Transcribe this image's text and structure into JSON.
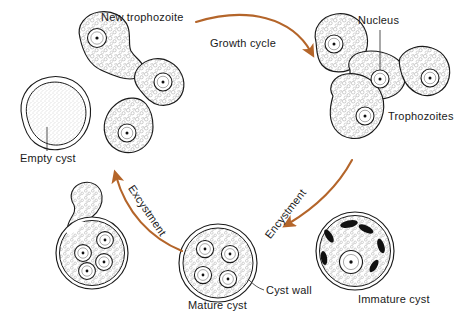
{
  "figure": {
    "title_text": "Entamoeba life cycle diagram",
    "ink_color": "#1a1a1a",
    "arrow_color": "#b4652a",
    "cell_fill": "#fefefe",
    "stipple_color": "#8a8a8a",
    "chromatoid_color": "#111111"
  },
  "labels": {
    "new_trophozoite": "New trophozoite",
    "growth_cycle": "Growth cycle",
    "nucleus": "Nucleus",
    "trophozoites": "Trophozoites",
    "empty_cyst": "Empty cyst",
    "excystment": "Excystment",
    "encystment": "Encystment",
    "mature_cyst": "Mature cyst",
    "cyst_wall": "Cyst wall",
    "immature_cyst": "Immature cyst"
  },
  "stages": [
    {
      "id": "new-trophozoite-chain",
      "name": "New trophozoite",
      "nuclei_count": 3,
      "description": "Three budding amoeboid cells connected in a chain, upper left"
    },
    {
      "id": "trophozoite-cluster",
      "name": "Trophozoites",
      "nuclei_count": 4,
      "description": "Cluster of four irregular trophozoites, upper right"
    },
    {
      "id": "immature-cyst",
      "name": "Immature cyst",
      "nuclei_count": 1,
      "chromatoid_bodies": 6,
      "description": "Round cyst with one nucleus and dark chromatoid bars"
    },
    {
      "id": "mature-cyst",
      "name": "Mature cyst",
      "nuclei_count": 4,
      "description": "Round cyst with double cyst wall and four nuclei"
    },
    {
      "id": "excysting-cyst",
      "name": "Excysting cyst",
      "nuclei_count": 4,
      "description": "Cyst with amoeba emerging through wall at upper left"
    },
    {
      "id": "empty-cyst",
      "name": "Empty cyst",
      "nuclei_count": 0,
      "description": "Collapsed cyst shell with no nuclei"
    }
  ],
  "arrows": [
    {
      "id": "growth-cycle-arrow",
      "label": "Growth cycle",
      "from": "new-trophozoite-chain",
      "to": "trophozoite-cluster"
    },
    {
      "id": "encystment-arrow",
      "label": "Encystment",
      "from": "trophozoites",
      "to": "mature-cyst"
    },
    {
      "id": "excystment-arrow",
      "label": "Excystment",
      "from": "mature-cyst",
      "to": "excysting-cyst"
    },
    {
      "id": "empty-cyst-arrow",
      "label": "",
      "from": "excysting-cyst",
      "to": "empty-cyst"
    }
  ]
}
